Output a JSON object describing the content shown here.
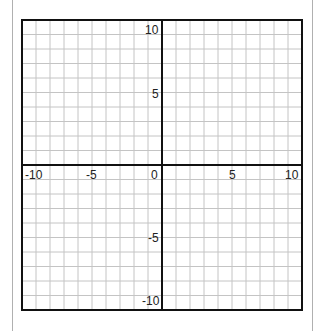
{
  "chart_data": {
    "type": "coordinate-grid",
    "title": "",
    "xlabel": "",
    "ylabel": "",
    "xlim": [
      -10,
      10
    ],
    "ylim": [
      -10,
      10
    ],
    "grid": true,
    "grid_step": 1,
    "x_tick_labels": [
      "-10",
      "-5",
      "0",
      "5",
      "10"
    ],
    "y_tick_labels": [
      "10",
      "5",
      "-5",
      "-10"
    ],
    "x_ticks": [
      -10,
      -5,
      0,
      5,
      10
    ],
    "y_ticks": [
      10,
      5,
      -5,
      -10
    ],
    "series": []
  },
  "labels": {
    "x_neg10": "-10",
    "x_neg5": "-5",
    "origin": "0",
    "x_5": "5",
    "x_10": "10",
    "y_10": "10",
    "y_5": "5",
    "y_neg5": "-5",
    "y_neg10": "-10"
  },
  "colors": {
    "grid": "#c4c4c4",
    "axis": "#111111",
    "frame": "#111111",
    "page_border": "#b0b0b0"
  }
}
